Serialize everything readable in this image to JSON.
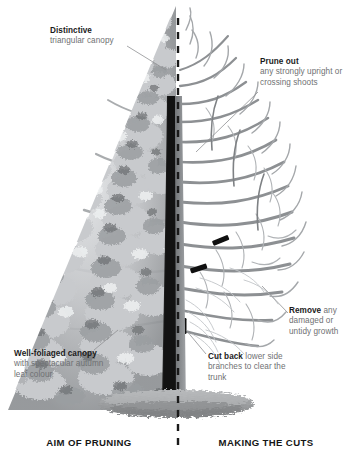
{
  "diagram": {
    "title_left": "AIM OF PRUNING",
    "title_right": "MAKING THE CUTS",
    "divider": {
      "style": "dashed-vertical",
      "x": 178,
      "color": "#1a1a1a"
    },
    "background": "#ffffff"
  },
  "labels": {
    "distinctive": {
      "head": "Distinctive",
      "body": "triangular canopy"
    },
    "prune_out": {
      "head": "Prune out",
      "body": "any strongly upright or crossing shoots"
    },
    "remove": {
      "head": "Remove",
      "body": " any damaged or untidy growth"
    },
    "well_foliaged": {
      "head": "Well-foliaged canopy",
      "body": " with spectacular autumn leaf colour"
    },
    "cut_back": {
      "head": "Cut back",
      "body": " lower side branches to clear the trunk"
    }
  },
  "colors": {
    "text_body": "#6f7173",
    "text_head": "#1b1b1b",
    "leader_line": "#8a8c8e",
    "canopy_mid": "#b4b6b8",
    "canopy_dark": "#76797c",
    "canopy_light": "#dcdee0",
    "branch": "#9a9da0",
    "branch_dark": "#6e7174",
    "trunk_dark": "#141414",
    "trunk_light": "#8c8f92",
    "cut_mark": "#101010",
    "mulch": "#a9abad",
    "mulch_dark": "#86888a"
  },
  "scene": {
    "left_side": "foliated half of tree with dense triangular canopy",
    "right_side": "bare pruned half of tree showing branch framework and cut marks",
    "ground": "mulch mound ellipse at base",
    "cut_marks_count": 3
  }
}
